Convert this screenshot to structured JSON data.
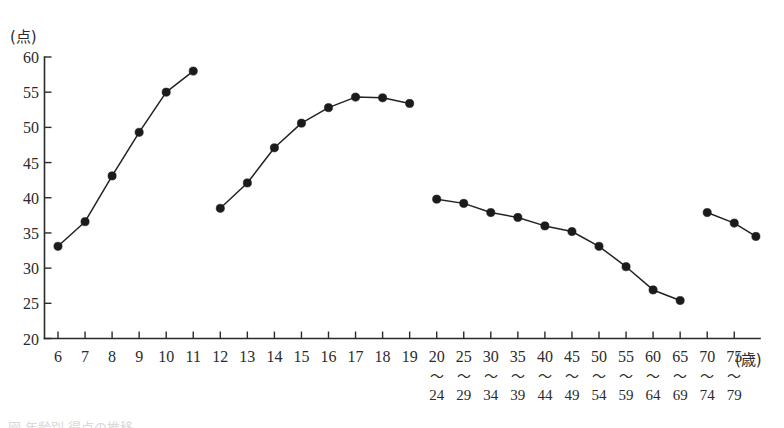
{
  "chart_data": {
    "type": "line",
    "title": "",
    "xlabel": "(歳)",
    "ylabel": "(点)",
    "y_unit": "(点)",
    "x_unit": "(歳)",
    "ylim": [
      20,
      60
    ],
    "y_ticks": [
      20,
      25,
      30,
      35,
      40,
      45,
      50,
      55,
      60
    ],
    "grid": false,
    "legend": "none",
    "categories": [
      "6",
      "7",
      "8",
      "9",
      "10",
      "11",
      "12",
      "13",
      "14",
      "15",
      "16",
      "17",
      "18",
      "19",
      "20",
      "25",
      "30",
      "35",
      "40",
      "45",
      "50",
      "55",
      "60",
      "65",
      "70",
      "75"
    ],
    "category_ranges": [
      {
        "top": "6",
        "bottom": ""
      },
      {
        "top": "7",
        "bottom": ""
      },
      {
        "top": "8",
        "bottom": ""
      },
      {
        "top": "9",
        "bottom": ""
      },
      {
        "top": "10",
        "bottom": ""
      },
      {
        "top": "11",
        "bottom": ""
      },
      {
        "top": "12",
        "bottom": ""
      },
      {
        "top": "13",
        "bottom": ""
      },
      {
        "top": "14",
        "bottom": ""
      },
      {
        "top": "15",
        "bottom": ""
      },
      {
        "top": "16",
        "bottom": ""
      },
      {
        "top": "17",
        "bottom": ""
      },
      {
        "top": "18",
        "bottom": ""
      },
      {
        "top": "19",
        "bottom": ""
      },
      {
        "top": "20",
        "bottom": "24"
      },
      {
        "top": "25",
        "bottom": "29"
      },
      {
        "top": "30",
        "bottom": "34"
      },
      {
        "top": "35",
        "bottom": "39"
      },
      {
        "top": "40",
        "bottom": "44"
      },
      {
        "top": "45",
        "bottom": "49"
      },
      {
        "top": "50",
        "bottom": "54"
      },
      {
        "top": "55",
        "bottom": "59"
      },
      {
        "top": "60",
        "bottom": "64"
      },
      {
        "top": "65",
        "bottom": "69"
      },
      {
        "top": "70",
        "bottom": "74"
      },
      {
        "top": "75",
        "bottom": "79"
      }
    ],
    "range_separator": "〜",
    "series": [
      {
        "name": "segment-1",
        "points": [
          {
            "x": "6",
            "y": 33.1
          },
          {
            "x": "7",
            "y": 36.6
          },
          {
            "x": "8",
            "y": 43.1
          },
          {
            "x": "9",
            "y": 49.3
          },
          {
            "x": "10",
            "y": 55.0
          },
          {
            "x": "11",
            "y": 58.0
          }
        ]
      },
      {
        "name": "segment-2",
        "points": [
          {
            "x": "12",
            "y": 38.5
          },
          {
            "x": "13",
            "y": 42.1
          },
          {
            "x": "14",
            "y": 47.1
          },
          {
            "x": "15",
            "y": 50.6
          },
          {
            "x": "16",
            "y": 52.8
          },
          {
            "x": "17",
            "y": 54.3
          },
          {
            "x": "18",
            "y": 54.2
          },
          {
            "x": "19",
            "y": 53.4
          }
        ]
      },
      {
        "name": "segment-3",
        "points": [
          {
            "x": "20",
            "y": 39.8
          },
          {
            "x": "25",
            "y": 39.2
          },
          {
            "x": "30",
            "y": 37.9
          },
          {
            "x": "35",
            "y": 37.2
          },
          {
            "x": "40",
            "y": 36.0
          },
          {
            "x": "45",
            "y": 35.2
          },
          {
            "x": "50",
            "y": 33.1
          },
          {
            "x": "55",
            "y": 30.2
          },
          {
            "x": "60",
            "y": 26.9
          },
          {
            "x": "65",
            "y": 25.4
          }
        ]
      },
      {
        "name": "segment-4",
        "points": [
          {
            "x": "70",
            "y": 37.9
          },
          {
            "x": "75",
            "y": 36.4
          },
          {
            "x": "79",
            "y": 34.5
          }
        ]
      }
    ]
  },
  "colors": {
    "axis": "#2b2b2b",
    "line": "#232323",
    "marker": "#1b1b1b",
    "background": "#ffffff"
  },
  "footer": {
    "fragment": "図 年齢別 得点の推移"
  }
}
